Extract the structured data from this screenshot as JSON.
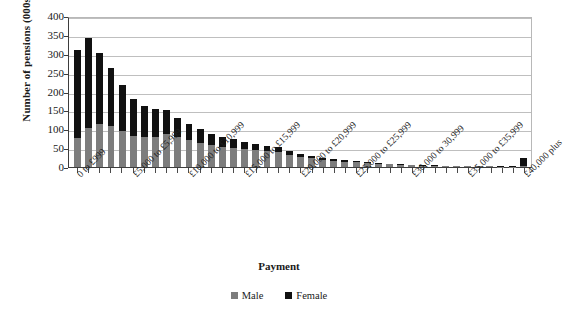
{
  "chart_data": {
    "type": "bar",
    "subtype": "stacked-column",
    "title": "",
    "xlabel": "Payment",
    "ylabel": "Number of pensions (000s)",
    "ylim": [
      0,
      400
    ],
    "yticks": [
      0,
      50,
      100,
      150,
      200,
      250,
      300,
      350,
      400
    ],
    "grid": true,
    "legend_position": "bottom",
    "categories": [
      "0 to £999",
      "£1,000 to £1,999",
      "£2,000 to £2,999",
      "£3,000 to £3,999",
      "£4,000 to £4,999",
      "£5,000 to £5,999",
      "£6,000 to £6,999",
      "£7,000 to £7,999",
      "£8,000 to £8,999",
      "£9,000 to £9,999",
      "£10,000 to £10,999",
      "£11,000 to £11,999",
      "£12,000 to £12,999",
      "£13,000 to £13,999",
      "£14,000 to £14,999",
      "£15,000 to £15,999",
      "£16,000 to £16,999",
      "£17,000 to £17,999",
      "£18,000 to £18,999",
      "£19,000 to £19,999",
      "£20,000 to £20,999",
      "£21,000 to £21,999",
      "£22,000 to £22,999",
      "£23,000 to £23,999",
      "£24,000 to £24,999",
      "£25,000 to £25,999",
      "£26,000 to £26,999",
      "£27,000 to £27,999",
      "£28,000 to £28,999",
      "£29,000 to £29,999",
      "£30,000 to 30,999",
      "£31,000 to £31,999",
      "£32,000 to £32,999",
      "£33,000 to £33,999",
      "£34,000 to £34,999",
      "£35,000 to £35,999",
      "£36,000 to £36,999",
      "£37,000 to £37,999",
      "£38,000 to £38,999",
      "£39,000 to £39,999",
      "£40,000 plus"
    ],
    "visible_tick_labels": [
      {
        "index": 0,
        "label": "0 to £999"
      },
      {
        "index": 5,
        "label": "£5,000 to £5,999"
      },
      {
        "index": 10,
        "label": "£10,000 to £10,999"
      },
      {
        "index": 15,
        "label": "£15,000 to £15,999"
      },
      {
        "index": 20,
        "label": "£20,000 to £20,999"
      },
      {
        "index": 25,
        "label": "£25,000 to £25,999"
      },
      {
        "index": 30,
        "label": "£30,000 to 30,999"
      },
      {
        "index": 35,
        "label": "£35,000 to £35,999"
      },
      {
        "index": 40,
        "label": "£40,000 plus"
      }
    ],
    "series": [
      {
        "name": "Male",
        "color": "#7d7d7d",
        "values": [
          78,
          104,
          114,
          108,
          96,
          81,
          80,
          80,
          87,
          80,
          72,
          64,
          59,
          54,
          51,
          47,
          45,
          42,
          39,
          33,
          27,
          23,
          19,
          16,
          14,
          12,
          10,
          8,
          7,
          6,
          5,
          4,
          3.5,
          3,
          2.5,
          2,
          1.8,
          1.5,
          1.2,
          1,
          4
        ]
      },
      {
        "name": "Female",
        "color": "#111111",
        "values": [
          232,
          237,
          188,
          155,
          120,
          99,
          81,
          75,
          63,
          50,
          43,
          36,
          29,
          25,
          22,
          18,
          17,
          15,
          13,
          10,
          7,
          6,
          5,
          4,
          3.5,
          3,
          2.5,
          2,
          1.8,
          1.5,
          1.2,
          1,
          1,
          0.8,
          0.8,
          0.6,
          0.5,
          0.5,
          0.4,
          0.4,
          21
        ]
      }
    ],
    "totals": [
      310,
      341,
      302,
      263,
      216,
      180,
      161,
      155,
      150,
      130,
      115,
      100,
      88,
      79,
      73,
      65,
      62,
      57,
      52,
      43,
      34,
      29,
      24,
      20,
      17.5,
      15,
      12.5,
      10,
      8.8,
      7.5,
      6.2,
      5,
      4.5,
      3.8,
      3.3,
      2.6,
      2.3,
      2,
      1.6,
      1.4,
      25
    ]
  },
  "legend": {
    "items": [
      {
        "label": "Male",
        "swatch": "grey-square-icon"
      },
      {
        "label": "Female",
        "swatch": "black-square-icon"
      }
    ]
  },
  "axes": {
    "y_title": "Number of pensions (000s)",
    "x_title": "Payment"
  }
}
